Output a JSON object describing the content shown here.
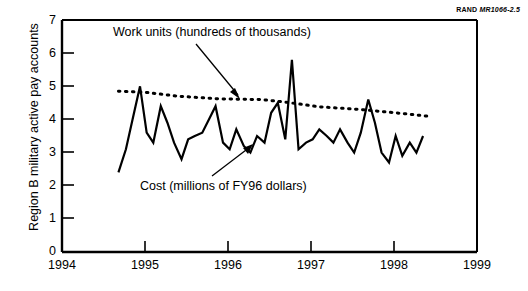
{
  "source_tag": {
    "brand": "RAND",
    "code": "MR1066-2.5"
  },
  "chart_data": {
    "type": "line",
    "title": "",
    "xlabel": "",
    "ylabel": "Region B military active pay accounts",
    "xlim": [
      1994,
      1999
    ],
    "ylim": [
      0,
      7
    ],
    "xticks": [
      "1994",
      "1995",
      "1996",
      "1997",
      "1998",
      "1999"
    ],
    "yticks": [
      "0",
      "1",
      "2",
      "3",
      "4",
      "5",
      "6",
      "7"
    ],
    "grid": false,
    "legend_position": "inline-annotations",
    "annotations": [
      {
        "text": "Work units (hundreds of thousands)",
        "target_series": "Work units"
      },
      {
        "text": "Cost (millions of FY96 dollars)",
        "target_series": "Cost"
      }
    ],
    "series": [
      {
        "name": "Cost",
        "label": "Cost (millions of FY96 dollars)",
        "style": "solid",
        "color": "#000000",
        "x": [
          1994.68,
          1994.77,
          1994.85,
          1994.94,
          1995.02,
          1995.1,
          1995.19,
          1995.27,
          1995.35,
          1995.44,
          1995.52,
          1995.6,
          1995.69,
          1995.77,
          1995.85,
          1995.94,
          1996.02,
          1996.1,
          1996.19,
          1996.27,
          1996.35,
          1996.44,
          1996.52,
          1996.6,
          1996.69,
          1996.77,
          1996.85,
          1996.94,
          1997.02,
          1997.1,
          1997.19,
          1997.27,
          1997.35,
          1997.44,
          1997.52,
          1997.6,
          1997.69,
          1997.77,
          1997.85,
          1997.94,
          1998.02,
          1998.1,
          1998.19,
          1998.27,
          1998.35
        ],
        "values": [
          2.4,
          3.1,
          4.0,
          5.0,
          3.6,
          3.3,
          4.4,
          3.9,
          3.3,
          2.8,
          3.4,
          3.5,
          3.6,
          4.0,
          4.4,
          3.3,
          3.1,
          3.7,
          3.2,
          3.0,
          3.5,
          3.3,
          4.2,
          4.5,
          3.4,
          5.8,
          3.1,
          3.3,
          3.4,
          3.7,
          3.5,
          3.3,
          3.7,
          3.3,
          3.0,
          3.6,
          4.6,
          3.9,
          3.0,
          2.7,
          3.5,
          2.9,
          3.3,
          3.0,
          3.5
        ]
      },
      {
        "name": "Work units",
        "label": "Work units (hundreds of thousands)",
        "style": "dotted",
        "color": "#000000",
        "x": [
          1994.68,
          1995.0,
          1995.4,
          1995.9,
          1996.4,
          1996.7,
          1997.1,
          1997.6,
          1998.1,
          1998.4
        ],
        "values": [
          4.85,
          4.82,
          4.7,
          4.62,
          4.6,
          4.52,
          4.38,
          4.3,
          4.18,
          4.1
        ]
      }
    ]
  }
}
